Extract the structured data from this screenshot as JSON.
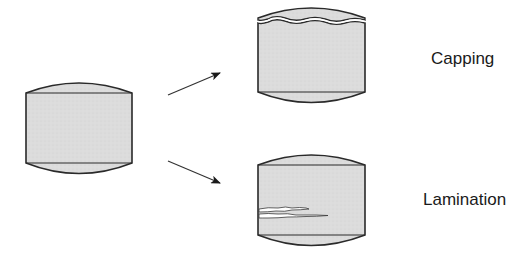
{
  "diagram": {
    "colors": {
      "fill": "#dcdcdc",
      "stroke": "#2a2a2a",
      "crack": "#ffffff",
      "background": "#ffffff"
    },
    "nodes": [
      {
        "id": "original-tablet",
        "label": ""
      },
      {
        "id": "capped-tablet",
        "label": "Capping"
      },
      {
        "id": "laminated-tablet",
        "label": "Lamination"
      }
    ],
    "edges": [
      {
        "from": "original-tablet",
        "to": "capped-tablet"
      },
      {
        "from": "original-tablet",
        "to": "laminated-tablet"
      }
    ],
    "labels": {
      "capping": "Capping",
      "lamination": "Lamination"
    }
  }
}
